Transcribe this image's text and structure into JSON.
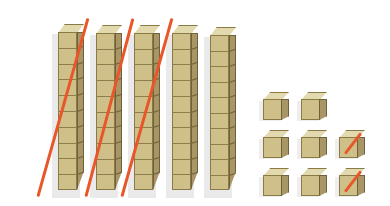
{
  "scene": {
    "title": "Base ten blocks subtraction model",
    "background_color": "#ffffff",
    "block_colors": {
      "top_face": "#e2daae",
      "front_face": "#cfc08a",
      "side_face": "#a89667",
      "edge": "#8a7a46",
      "strike": "#e8562a",
      "shadow": "#d8d8d8"
    }
  },
  "rods": {
    "label": "ten-rods",
    "count": 5,
    "units_per_rod": 10,
    "total_value": 50,
    "items": [
      {
        "name": "rod-1",
        "x": 58,
        "y": 24,
        "width": 26,
        "height": 166,
        "segments": 10,
        "value": 10,
        "crossed_out": true
      },
      {
        "name": "rod-2",
        "x": 96,
        "y": 25,
        "width": 26,
        "height": 165,
        "segments": 10,
        "value": 10,
        "crossed_out": true
      },
      {
        "name": "rod-3",
        "x": 134,
        "y": 25,
        "width": 26,
        "height": 165,
        "segments": 10,
        "value": 10,
        "crossed_out": true
      },
      {
        "name": "rod-4",
        "x": 172,
        "y": 25,
        "width": 26,
        "height": 165,
        "segments": 10,
        "value": 10,
        "crossed_out": false
      },
      {
        "name": "rod-5",
        "x": 210,
        "y": 27,
        "width": 26,
        "height": 163,
        "segments": 10,
        "value": 10,
        "crossed_out": false
      }
    ]
  },
  "rod_strikes": {
    "label": "red diagonal cross-out lines over rods",
    "count": 3,
    "color": "#e8562a",
    "items": [
      {
        "name": "rod-strike-1",
        "x1": 38,
        "y1": 196,
        "x2": 88,
        "y2": 18
      },
      {
        "name": "rod-strike-2",
        "x1": 86,
        "y1": 196,
        "x2": 133,
        "y2": 18
      },
      {
        "name": "rod-strike-3",
        "x1": 122,
        "y1": 196,
        "x2": 172,
        "y2": 18
      }
    ]
  },
  "units": {
    "label": "unit cubes",
    "count": 8,
    "total_value": 8,
    "rows": [
      {
        "name": "unit-row-1",
        "y": 92,
        "cubes": [
          {
            "name": "unit-cube-r1c1",
            "x": 263,
            "crossed_out": false
          },
          {
            "name": "unit-cube-r1c2",
            "x": 301,
            "crossed_out": false
          }
        ]
      },
      {
        "name": "unit-row-2",
        "y": 130,
        "cubes": [
          {
            "name": "unit-cube-r2c1",
            "x": 263,
            "crossed_out": false
          },
          {
            "name": "unit-cube-r2c2",
            "x": 301,
            "crossed_out": false
          },
          {
            "name": "unit-cube-r2c3",
            "x": 339,
            "crossed_out": true
          }
        ]
      },
      {
        "name": "unit-row-3",
        "y": 168,
        "cubes": [
          {
            "name": "unit-cube-r3c1",
            "x": 263,
            "crossed_out": false
          },
          {
            "name": "unit-cube-r3c2",
            "x": 301,
            "crossed_out": false
          },
          {
            "name": "unit-cube-r3c3",
            "x": 339,
            "crossed_out": true
          }
        ]
      }
    ]
  },
  "summary": {
    "tens_shown": 5,
    "tens_crossed_out": 3,
    "ones_shown": 8,
    "ones_crossed_out": 2,
    "total_shown": 58,
    "total_crossed_out": 32,
    "remaining": 26
  }
}
